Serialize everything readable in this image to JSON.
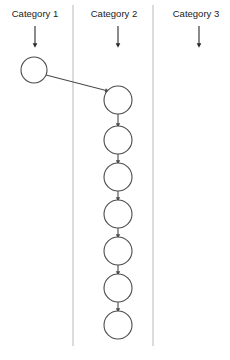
{
  "canvas": {
    "width": 230,
    "height": 360,
    "background": "#ffffff"
  },
  "style": {
    "lane_divider_color": "#b8b8b8",
    "label_color": "#1a1a1a",
    "node_stroke_color": "#4a4a4a",
    "node_fill_color": "#ffffff",
    "edge_color": "#4a4a4a",
    "arrow_color": "#2b2b2b"
  },
  "lanes": [
    {
      "id": "lane-1",
      "label": "Category 1",
      "label_x": 35,
      "label_y": 14,
      "arrow_x": 35,
      "arrow_y_start": 26,
      "arrow_y_end": 46
    },
    {
      "id": "lane-2",
      "label": "Category 2",
      "label_x": 114,
      "label_y": 14,
      "arrow_x": 118,
      "arrow_y_start": 26,
      "arrow_y_end": 46
    },
    {
      "id": "lane-3",
      "label": "Category 3",
      "label_x": 196,
      "label_y": 14,
      "arrow_x": 199,
      "arrow_y_start": 26,
      "arrow_y_end": 46
    }
  ],
  "dividers": [
    {
      "id": "divider-1",
      "x": 73,
      "y_start": 5,
      "y_end": 346
    },
    {
      "id": "divider-2",
      "x": 153,
      "y_start": 5,
      "y_end": 346
    }
  ],
  "nodes": [
    {
      "id": "n1",
      "lane": "lane-1",
      "cx": 34,
      "cy": 70,
      "r": 13
    },
    {
      "id": "n2",
      "lane": "lane-2",
      "cx": 118,
      "cy": 100,
      "r": 14
    },
    {
      "id": "n3",
      "lane": "lane-2",
      "cx": 118,
      "cy": 140,
      "r": 14
    },
    {
      "id": "n4",
      "lane": "lane-2",
      "cx": 118,
      "cy": 177,
      "r": 14
    },
    {
      "id": "n5",
      "lane": "lane-2",
      "cx": 118,
      "cy": 214,
      "r": 14
    },
    {
      "id": "n6",
      "lane": "lane-2",
      "cx": 118,
      "cy": 251,
      "r": 14
    },
    {
      "id": "n7",
      "lane": "lane-2",
      "cx": 118,
      "cy": 288,
      "r": 14
    },
    {
      "id": "n8",
      "lane": "lane-2",
      "cx": 118,
      "cy": 325,
      "r": 14
    }
  ],
  "edges": [
    {
      "id": "e1",
      "from": "n1",
      "to": "n2",
      "x1": 46,
      "y1": 75,
      "x2": 108,
      "y2": 91,
      "arrow": true
    },
    {
      "id": "e2",
      "from": "n2",
      "to": "n3",
      "x1": 118,
      "y1": 114,
      "x2": 118,
      "y2": 126,
      "arrow": true
    },
    {
      "id": "e3",
      "from": "n3",
      "to": "n4",
      "x1": 118,
      "y1": 154,
      "x2": 118,
      "y2": 163,
      "arrow": true
    },
    {
      "id": "e4",
      "from": "n4",
      "to": "n5",
      "x1": 118,
      "y1": 191,
      "x2": 118,
      "y2": 200,
      "arrow": true
    },
    {
      "id": "e5",
      "from": "n5",
      "to": "n6",
      "x1": 118,
      "y1": 228,
      "x2": 118,
      "y2": 237,
      "arrow": true
    },
    {
      "id": "e6",
      "from": "n6",
      "to": "n7",
      "x1": 118,
      "y1": 265,
      "x2": 118,
      "y2": 274,
      "arrow": true
    },
    {
      "id": "e7",
      "from": "n7",
      "to": "n8",
      "x1": 118,
      "y1": 302,
      "x2": 118,
      "y2": 311,
      "arrow": true
    }
  ]
}
